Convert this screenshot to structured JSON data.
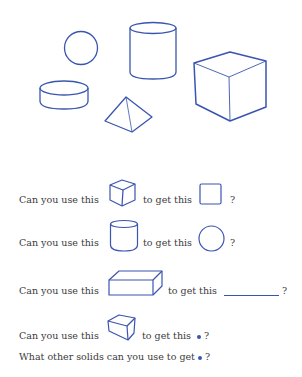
{
  "colors": {
    "shape_stroke": "#3a55b0",
    "text": "#3a3a3a"
  },
  "figure": {
    "solids": [
      "sphere",
      "cylinder",
      "cube",
      "disc",
      "pyramid"
    ]
  },
  "questions": [
    {
      "prefix": "Can you use this",
      "solid": "cube",
      "mid": "to get this",
      "result": "square",
      "suffix": "?"
    },
    {
      "prefix": "Can you use this",
      "solid": "cylinder",
      "mid": "to get this",
      "result": "circle",
      "suffix": "?"
    },
    {
      "prefix": "Can you use this",
      "solid": "rectangular-prism",
      "mid": "to get this",
      "result": "blank",
      "suffix": "?"
    },
    {
      "prefix": "Can you use this",
      "solid": "cube",
      "mid": "to get this",
      "result": "point",
      "suffix": "?"
    }
  ],
  "final_question": {
    "text": "What other solids can you use to get",
    "suffix": "?"
  }
}
